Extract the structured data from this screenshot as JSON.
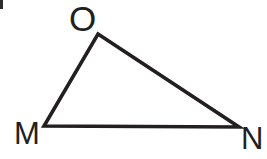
{
  "figure": {
    "name": "triangle-mno",
    "kind": "geometry-diagram",
    "background_color": "#ffffff",
    "stroke_color": "#231f20",
    "stroke_width": 3.6,
    "width": 267,
    "height": 159,
    "labels": {
      "apex": "O",
      "bottom_left": "M",
      "bottom_right": "N"
    },
    "vertices": [
      {
        "id": "O",
        "label": "O",
        "x": 98,
        "y": 34
      },
      {
        "id": "M",
        "label": "M",
        "x": 44,
        "y": 126
      },
      {
        "id": "N",
        "label": "N",
        "x": 239,
        "y": 127
      }
    ],
    "edges": [
      {
        "id": "MO",
        "from": "M",
        "to": "O"
      },
      {
        "id": "ON",
        "from": "O",
        "to": "N"
      },
      {
        "id": "MN",
        "from": "M",
        "to": "N"
      }
    ],
    "polygon_points": "98,34 239,127 44,126",
    "artifact": {
      "name": "scan-artifact",
      "color": "#2e2a2b"
    }
  }
}
